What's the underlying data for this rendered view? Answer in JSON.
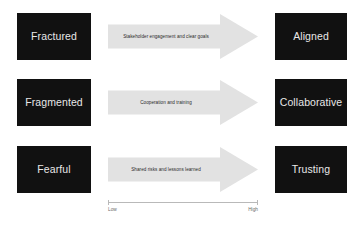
{
  "diagram": {
    "colors": {
      "box_background": "#111111",
      "box_text": "#e8e8e8",
      "arrow_fill": "#e2e2e2",
      "arrow_text": "#2a2a2a",
      "axis_line": "#b9b9b9",
      "axis_text": "#6b6b6b",
      "page_background": "#ffffff"
    },
    "rows": [
      {
        "from_state": "Fractured",
        "arrow_label": "Stakeholder engagement and clear goals",
        "to_state": "Aligned"
      },
      {
        "from_state": "Fragmented",
        "arrow_label": "Cooperation and training",
        "to_state": "Collaborative"
      },
      {
        "from_state": "Fearful",
        "arrow_label": "Shared risks and lessons learned",
        "to_state": "Trusting"
      }
    ],
    "scale": {
      "low_label": "Low",
      "high_label": "High"
    }
  }
}
